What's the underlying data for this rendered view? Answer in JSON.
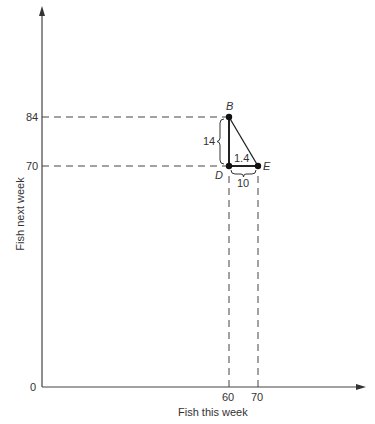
{
  "diagram": {
    "x_axis_label": "Fish this week",
    "y_axis_label": "Fish next week",
    "origin_label": "0",
    "x_ticks": [
      "60",
      "70"
    ],
    "y_ticks": [
      "84",
      "70"
    ],
    "points": {
      "B": {
        "label": "B",
        "x": 60,
        "y": 84
      },
      "D": {
        "label": "D",
        "x": 60,
        "y": 70
      },
      "E": {
        "label": "E",
        "x": 70,
        "y": 70
      }
    },
    "annotations": {
      "vertical_gap": "14",
      "horizontal_gap": "10",
      "slope": "1.4"
    }
  }
}
